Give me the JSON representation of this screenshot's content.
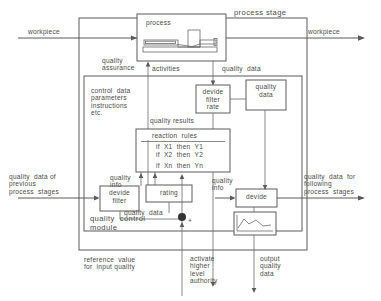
{
  "figure": {
    "title": "process stage",
    "type": "block-diagram"
  },
  "flow_labels": {
    "workpiece_in": "workpiece",
    "workpiece_out": "workpiece",
    "quality_assurance": "quality\nassurance",
    "activities": "activities",
    "quality_data_top": "quality  data",
    "quality_data_right_of_filter": "quality\ndata",
    "quality_results": "quality results",
    "quality_info_left": "quality\ninfo",
    "quality_info_right": "quality\ninfo",
    "quality_data_module": "quality  data",
    "control_data": "control  data\nparameters\ninstructions\netc.",
    "quality_data_previous": "quality  data of\nprevious\nprocess  stages",
    "quality_data_following": "quality  data  for\nfollowing\nprocess  stages",
    "reference_value": "reference  value\nfor  input quality",
    "activate_authority": "activate\nhigher\nlevel\nauthority",
    "output_quality_data": "output\nquality\ndata",
    "plus_sign": "+"
  },
  "boxes": {
    "process": {
      "label": "process",
      "icon": "lathe-machine-icon"
    },
    "devide_filter_rate": {
      "label": "devide\nfilter\nrate"
    },
    "quality_data_store": {
      "label": "quality\ndata"
    },
    "reaction_rules": {
      "title": "reaction  rules",
      "rules": [
        "if  X1  then  Y1",
        "if  X2  then  Y2",
        "if  Xn  then  Yn"
      ]
    },
    "devide_filter": {
      "label": "devide\nfilter"
    },
    "rating": {
      "label": "rating"
    },
    "devide_right": {
      "label": "devide"
    },
    "chart": {
      "label": "",
      "icon": "line-chart-icon"
    },
    "quality_control_module": {
      "label": "quality  control\nmodule"
    }
  },
  "colors": {
    "line": "#5a5a5a",
    "text": "#4a4a4a",
    "background": "#ffffff",
    "junction": "#333333"
  }
}
